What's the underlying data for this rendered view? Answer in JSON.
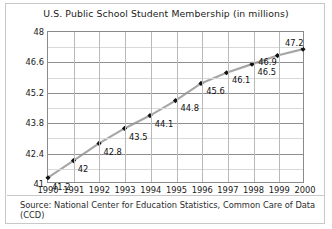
{
  "chart_data": {
    "type": "line",
    "title": "U.S. Public School Student Membership (in millions)",
    "xlabel": "",
    "ylabel": "",
    "categories": [
      "1990",
      "1991",
      "1992",
      "1993",
      "1994",
      "1995",
      "1996",
      "1997",
      "1998",
      "1999",
      "2000"
    ],
    "values": [
      41.2,
      42,
      42.8,
      43.5,
      44.1,
      44.8,
      45.6,
      46.1,
      46.5,
      46.9,
      47.2
    ],
    "point_labels": [
      "41.2",
      "42",
      "42.8",
      "43.5",
      "44.1",
      "44.8",
      "45.6",
      "46.1",
      "46.5",
      "46.9",
      "47.2"
    ],
    "ylim": [
      41,
      48
    ],
    "yticks": [
      "41",
      "42.4",
      "43.8",
      "45.2",
      "46.6",
      "48"
    ],
    "ytick_values": [
      41,
      42.4,
      43.8,
      45.2,
      46.6,
      48
    ],
    "minor_gridlines": true,
    "grid": true,
    "legend": "none",
    "line_color": "#a6a6a6",
    "marker_color": "#111111",
    "marker": "diamond",
    "source": "Source: National Center for Education Statistics, Common Care of Data (CCD)"
  }
}
